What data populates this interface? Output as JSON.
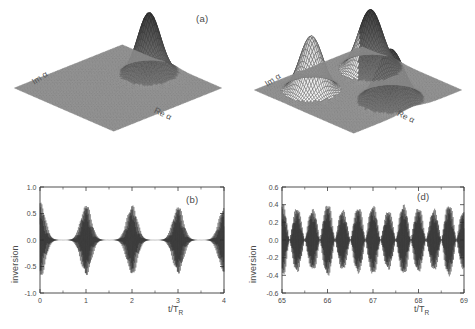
{
  "figure": {
    "panels": [
      "a",
      "b",
      "c",
      "d"
    ],
    "background": "#ffffff",
    "ink": "#3a3a3a"
  },
  "panel_a": {
    "tag": "(a)",
    "xlabel": "Re α",
    "ylabel": "Im α",
    "surface_color": "#8a8a8a"
  },
  "panel_c": {
    "tag": "(c)",
    "xlabel": "Re α",
    "ylabel": "Im α",
    "surface_color": "#8a8a8a"
  },
  "panel_b": {
    "tag": "(b)",
    "ylabel": "inversion",
    "xlabel_num": "t",
    "xlabel_den": "T",
    "xlabel_sub": "R"
  },
  "panel_d": {
    "tag": "(d)",
    "ylabel": "inversion",
    "xlabel_num": "t",
    "xlabel_den": "T",
    "xlabel_sub": "R"
  },
  "chart_data": [
    {
      "type": "surface",
      "panel": "a",
      "title": "(a)",
      "xlabel": "Re α",
      "ylabel": "Im α",
      "zlabel": "Q(α)",
      "description": "Husimi Q-function of a coherent state: single Gaussian peak on a flat base plane.",
      "grid": false,
      "legend": null,
      "view": {
        "azimuth_deg": -40,
        "elevation_deg": 28
      },
      "xlim": [
        -4,
        4
      ],
      "ylim": [
        -4,
        4
      ],
      "zlim": [
        0,
        1
      ],
      "peaks": [
        {
          "x": 2.4,
          "y": 0.1,
          "amplitude": 1.0,
          "sigma": 0.62
        }
      ]
    },
    {
      "type": "surface",
      "panel": "c",
      "title": "(c)",
      "xlabel": "Re α",
      "ylabel": "Im α",
      "zlabel": "Q(α)",
      "description": "Husimi Q-function of a three-component Schroedinger-cat state: three Gaussian lobes arranged around the origin.",
      "grid": false,
      "legend": null,
      "view": {
        "azimuth_deg": -40,
        "elevation_deg": 28
      },
      "xlim": [
        -4,
        4
      ],
      "ylim": [
        -4,
        4
      ],
      "zlim": [
        0,
        1
      ],
      "peaks": [
        {
          "x": 2.3,
          "y": 1.5,
          "amplitude": 1.0,
          "sigma": 0.66
        },
        {
          "x": -1.9,
          "y": 1.7,
          "amplitude": 0.92,
          "sigma": 0.62
        },
        {
          "x": 0.3,
          "y": -2.3,
          "amplitude": 0.86,
          "sigma": 0.72
        }
      ]
    },
    {
      "type": "line",
      "panel": "b",
      "title": "(b)",
      "xlabel": "t/T_R",
      "ylabel": "inversion",
      "xlim": [
        0,
        4
      ],
      "ylim": [
        -1.0,
        1.0
      ],
      "xticks": [
        0,
        1,
        2,
        3,
        4
      ],
      "xticklabels": [
        "0",
        "1",
        "2",
        "3",
        "4"
      ],
      "yticks": [
        -1.0,
        -0.5,
        0.0,
        0.5,
        1.0
      ],
      "yticklabels": [
        "-1.0",
        "-0.5",
        "0.0",
        "0.5",
        "1.0"
      ],
      "grid": false,
      "legend": null,
      "description": "Atomic inversion vs scaled time showing collapse-and-revival; revival bursts centred at t/T_R = 0, 1, 2, 3, 4 separated by collapse regions where the inversion is ~0.",
      "envelope": {
        "revival_centers": [
          0,
          1,
          2,
          3,
          4
        ],
        "revival_peak_amplitudes": [
          0.95,
          0.9,
          0.88,
          0.86,
          0.84
        ],
        "revival_width": 0.17,
        "carrier_cycles_per_unit": 150
      }
    },
    {
      "type": "line",
      "panel": "d",
      "title": "(d)",
      "xlabel": "t/T_R",
      "ylabel": "inversion",
      "xlim": [
        65,
        69
      ],
      "ylim": [
        -0.6,
        0.6
      ],
      "xticks": [
        65,
        66,
        67,
        68,
        69
      ],
      "xticklabels": [
        "65",
        "66",
        "67",
        "68",
        "69"
      ],
      "yticks": [
        -0.6,
        -0.4,
        -0.2,
        0.0,
        0.2,
        0.4,
        0.6
      ],
      "yticklabels": [
        "-0.6",
        "-0.4",
        "-0.2",
        "0.0",
        "0.2",
        "0.4",
        "0.6"
      ],
      "grid": false,
      "legend": null,
      "description": "Atomic inversion at late times (t/T_R = 65 to 69): overlapping revivals merge into a quasi-periodic beat pattern of about 12 bursts with amplitude ~0.5.",
      "envelope": {
        "bursts_per_unit": 3,
        "burst_count": 12,
        "peak_amplitude": 0.52,
        "carrier_cycles_per_unit": 150
      }
    }
  ]
}
